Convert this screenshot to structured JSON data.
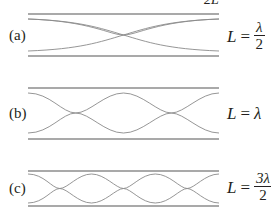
{
  "figure": {
    "top_cutoff_text": "2L",
    "panels": [
      {
        "id": "a",
        "label": "(a)",
        "equation": {
          "lhs": "L",
          "op": "=",
          "numerator": "λ",
          "denominator": "2"
        },
        "half_wavelengths": 1
      },
      {
        "id": "b",
        "label": "(b)",
        "equation": {
          "lhs": "L",
          "op": "=",
          "value": "λ"
        },
        "half_wavelengths": 2
      },
      {
        "id": "c",
        "label": "(c)",
        "equation": {
          "lhs": "L",
          "op": "=",
          "numerator": "3λ",
          "denominator": "2"
        },
        "half_wavelengths": 3
      }
    ],
    "colors": {
      "wall": "#555555",
      "wave": "#8a8a8a",
      "text": "#231f20"
    }
  }
}
